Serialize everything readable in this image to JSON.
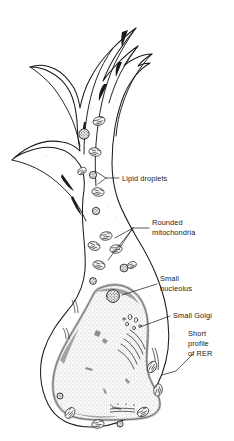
{
  "figure": {
    "type": "biological-cell-diagram",
    "background_color": "#ffffff",
    "line_color": "#1a1a1a",
    "cytoplasm_fill": "#ffffff",
    "nucleus_fill": "#f2f2f2",
    "organelle_dark_color": "#2b2b2b"
  },
  "labels": [
    {
      "id": "lipid-droplets",
      "text": "Lipid droplets",
      "lines": [
        "Lipid droplets"
      ],
      "x": 122,
      "y": 180
    },
    {
      "id": "rounded-mitochondria",
      "text": "Rounded mitochondria",
      "lines": [
        "Rounded",
        "mitochondria"
      ],
      "x": 152,
      "y": 232
    },
    {
      "id": "small-nucleolus",
      "text": "Small nucleolus",
      "lines": [
        "Small",
        "nucleolus"
      ],
      "x": 160,
      "y": 285
    },
    {
      "id": "small-golgi",
      "text": "Small Golgi",
      "lines": [
        "Small Golgi"
      ],
      "x": 173,
      "y": 317
    },
    {
      "id": "short-profile-of-rer",
      "text": "Short profile of RER",
      "lines": [
        "Short",
        "profile",
        "of RER"
      ],
      "x": 188,
      "y": 337
    }
  ],
  "structures": [
    {
      "id": "cell-body",
      "name": "cell body"
    },
    {
      "id": "nucleus",
      "name": "nucleus"
    },
    {
      "id": "nucleolus",
      "name": "nucleolus"
    },
    {
      "id": "golgi",
      "name": "Golgi apparatus"
    },
    {
      "id": "mitochondria",
      "name": "mitochondria"
    },
    {
      "id": "lipid-droplet",
      "name": "lipid droplet"
    },
    {
      "id": "rer",
      "name": "rough endoplasmic reticulum"
    },
    {
      "id": "processes",
      "name": "cell processes"
    }
  ]
}
